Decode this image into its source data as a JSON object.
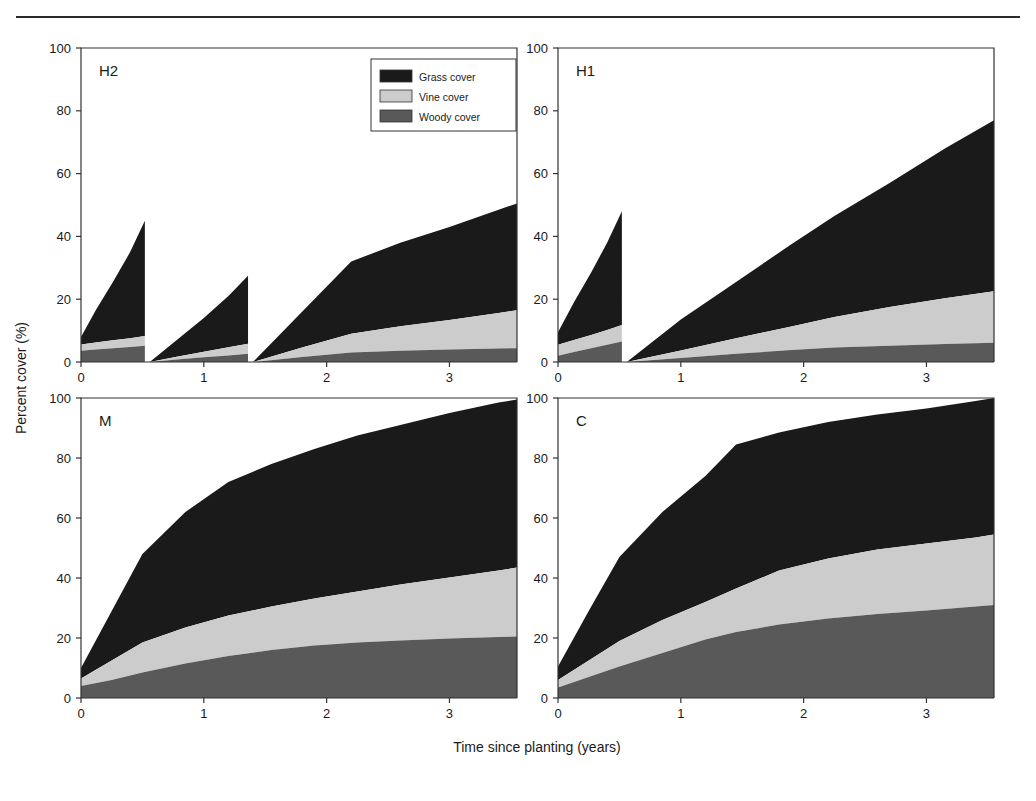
{
  "figure": {
    "x_axis_label": "Time since planting (years)",
    "y_axis_label": "Percent cover (%)",
    "x_ticks": [
      "0",
      "1",
      "2",
      "3"
    ],
    "y_ticks": [
      "0",
      "20",
      "40",
      "60",
      "80",
      "100"
    ]
  },
  "legend": {
    "position": "top-left-panel-upper-right",
    "items": [
      {
        "label": "Grass cover",
        "color": "#1a1a1a"
      },
      {
        "label": "Vine cover",
        "color": "#cccccc"
      },
      {
        "label": "Woody cover",
        "color": "#595959"
      }
    ]
  },
  "panels": [
    {
      "id": "H2",
      "label": "H2"
    },
    {
      "id": "H1",
      "label": "H1"
    },
    {
      "id": "M",
      "label": "M"
    },
    {
      "id": "C",
      "label": "C"
    }
  ],
  "chart_data": {
    "type": "area",
    "title": "",
    "xlabel": "Time since planting (years)",
    "ylabel": "Percent cover (%)",
    "xlim": [
      0,
      3.55
    ],
    "ylim": [
      0,
      100
    ],
    "grid": false,
    "stacked": true,
    "stack_order": [
      "Woody cover",
      "Vine cover",
      "Grass cover"
    ],
    "legend": [
      "Grass cover",
      "Vine cover",
      "Woody cover"
    ],
    "legend_position": "inside top-right of panel H2",
    "colors": {
      "Grass cover": "#1a1a1a",
      "Vine cover": "#cccccc",
      "Woody cover": "#595959"
    },
    "panels": [
      {
        "name": "H2",
        "label": "H2",
        "description": "High-intensity, repeated mowing; three sawtooth regrowth cycles with cuts at 0.52 and 1.36 years",
        "segments": [
          {
            "x": [
              0,
              0.12,
              0.26,
              0.4,
              0.52
            ],
            "series": [
              {
                "name": "Woody cover",
                "values": [
                  3.6,
                  4.0,
                  4.4,
                  4.8,
                  5.2
                ]
              },
              {
                "name": "Vine cover",
                "values": [
                  5.6,
                  6.2,
                  6.9,
                  7.6,
                  8.3
                ]
              },
              {
                "name": "Grass cover",
                "values": [
                  8.0,
                  16.5,
                  25.5,
                  35.0,
                  45.0
                ]
              }
            ]
          },
          {
            "x": [
              0.56,
              0.78,
              1.0,
              1.2,
              1.36
            ],
            "series": [
              {
                "name": "Woody cover",
                "values": [
                  0.0,
                  0.8,
                  1.5,
                  2.1,
                  2.6
                ]
              },
              {
                "name": "Vine cover",
                "values": [
                  0.0,
                  1.7,
                  3.3,
                  4.7,
                  5.8
                ]
              },
              {
                "name": "Grass cover",
                "values": [
                  0.0,
                  7.0,
                  14.0,
                  21.0,
                  27.5
                ]
              }
            ]
          },
          {
            "x": [
              1.4,
              1.8,
              2.2,
              2.6,
              3.0,
              3.4,
              3.55
            ],
            "series": [
              {
                "name": "Woody cover",
                "values": [
                  0.0,
                  1.6,
                  3.0,
                  3.6,
                  4.0,
                  4.3,
                  4.4
                ]
              },
              {
                "name": "Vine cover",
                "values": [
                  0.0,
                  4.6,
                  9.0,
                  11.4,
                  13.4,
                  15.6,
                  16.5
                ]
              },
              {
                "name": "Grass cover",
                "values": [
                  0.0,
                  16.0,
                  32.0,
                  38.0,
                  43.0,
                  48.5,
                  50.5
                ]
              }
            ]
          }
        ]
      },
      {
        "name": "H1",
        "label": "H1",
        "description": "Single mowing at 0.52 years, then uninterrupted regrowth to ~77% by 3.5 years",
        "segments": [
          {
            "x": [
              0,
              0.13,
              0.27,
              0.4,
              0.52
            ],
            "series": [
              {
                "name": "Woody cover",
                "values": [
                  2.0,
                  3.2,
                  4.4,
                  5.5,
                  6.5
                ]
              },
              {
                "name": "Vine cover",
                "values": [
                  5.5,
                  7.0,
                  8.6,
                  10.2,
                  11.8
                ]
              },
              {
                "name": "Grass cover",
                "values": [
                  9.5,
                  19.0,
                  28.5,
                  38.0,
                  48.0
                ]
              }
            ]
          },
          {
            "x": [
              0.56,
              1.0,
              1.45,
              1.9,
              2.25,
              2.7,
              3.15,
              3.55
            ],
            "series": [
              {
                "name": "Woody cover",
                "values": [
                  0.0,
                  1.3,
                  2.6,
                  3.8,
                  4.6,
                  5.2,
                  5.7,
                  6.1
                ]
              },
              {
                "name": "Vine cover",
                "values": [
                  0.0,
                  3.7,
                  7.6,
                  11.3,
                  14.3,
                  17.5,
                  20.3,
                  22.5
                ]
              },
              {
                "name": "Grass cover",
                "values": [
                  0.0,
                  13.5,
                  25.5,
                  37.5,
                  46.5,
                  57.0,
                  68.0,
                  77.0
                ]
              }
            ]
          }
        ]
      },
      {
        "name": "M",
        "label": "M",
        "description": "Moderate treatment; no cutting, saturating growth reaching 100% total cover",
        "segments": [
          {
            "x": [
              0,
              0.25,
              0.5,
              0.85,
              1.2,
              1.55,
              1.9,
              2.25,
              2.6,
              3.0,
              3.4,
              3.55
            ],
            "series": [
              {
                "name": "Woody cover",
                "values": [
                  4.0,
                  6.0,
                  8.5,
                  11.5,
                  14.0,
                  16.0,
                  17.5,
                  18.5,
                  19.2,
                  19.8,
                  20.3,
                  20.5
                ]
              },
              {
                "name": "Vine cover",
                "values": [
                  6.5,
                  12.5,
                  18.5,
                  23.5,
                  27.5,
                  30.5,
                  33.2,
                  35.5,
                  37.8,
                  40.2,
                  42.5,
                  43.5
                ]
              },
              {
                "name": "Grass cover",
                "values": [
                  10.0,
                  29.0,
                  48.0,
                  62.0,
                  72.0,
                  78.0,
                  83.0,
                  87.5,
                  91.0,
                  95.0,
                  98.5,
                  99.5
                ]
              }
            ]
          }
        ]
      },
      {
        "name": "C",
        "label": "C",
        "description": "Control; no cutting, highest woody and vine cover, total reaching 100%",
        "segments": [
          {
            "x": [
              0,
              0.25,
              0.5,
              0.85,
              1.2,
              1.45,
              1.8,
              2.2,
              2.6,
              3.0,
              3.4,
              3.55
            ],
            "series": [
              {
                "name": "Woody cover",
                "values": [
                  3.5,
                  7.0,
                  10.5,
                  15.0,
                  19.5,
                  22.0,
                  24.5,
                  26.5,
                  28.0,
                  29.2,
                  30.5,
                  31.0
                ]
              },
              {
                "name": "Vine cover",
                "values": [
                  6.0,
                  12.5,
                  19.0,
                  26.0,
                  32.0,
                  36.5,
                  42.5,
                  46.5,
                  49.5,
                  51.5,
                  53.5,
                  54.5
                ]
              },
              {
                "name": "Grass cover",
                "values": [
                  10.5,
                  29.0,
                  47.0,
                  62.0,
                  74.0,
                  84.5,
                  88.5,
                  92.0,
                  94.5,
                  96.5,
                  99.0,
                  100.0
                ]
              }
            ]
          }
        ]
      }
    ]
  }
}
